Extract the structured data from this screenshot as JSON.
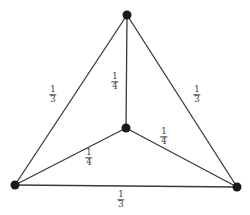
{
  "diagram": {
    "type": "weighted graph (K4 drawn as triangle with central vertex)",
    "colors": {
      "edge": "#3a3a3a",
      "node": "#1a1a1a",
      "label": "#333333",
      "background": "#ffffff"
    },
    "nodes": [
      {
        "id": "top",
        "x": 127,
        "y": 15
      },
      {
        "id": "left",
        "x": 15,
        "y": 185
      },
      {
        "id": "right",
        "x": 237,
        "y": 187
      },
      {
        "id": "center",
        "x": 126,
        "y": 128
      }
    ],
    "edges": [
      {
        "id": "top-left",
        "from": "top",
        "to": "left",
        "weight": {
          "num": "1",
          "den": "3"
        },
        "label_pos": {
          "x": 53,
          "y": 95
        }
      },
      {
        "id": "top-right",
        "from": "top",
        "to": "right",
        "weight": {
          "num": "1",
          "den": "3"
        },
        "label_pos": {
          "x": 197,
          "y": 95
        }
      },
      {
        "id": "left-right",
        "from": "left",
        "to": "right",
        "weight": {
          "num": "1",
          "den": "3"
        },
        "label_pos": {
          "x": 121,
          "y": 200
        }
      },
      {
        "id": "top-center",
        "from": "top",
        "to": "center",
        "weight": {
          "num": "1",
          "den": "4"
        },
        "label_pos": {
          "x": 115,
          "y": 82
        }
      },
      {
        "id": "center-left",
        "from": "center",
        "to": "left",
        "weight": {
          "num": "1",
          "den": "4"
        },
        "label_pos": {
          "x": 89,
          "y": 158
        }
      },
      {
        "id": "center-right",
        "from": "center",
        "to": "right",
        "weight": {
          "num": "1",
          "den": "4"
        },
        "label_pos": {
          "x": 164,
          "y": 137
        }
      }
    ]
  }
}
